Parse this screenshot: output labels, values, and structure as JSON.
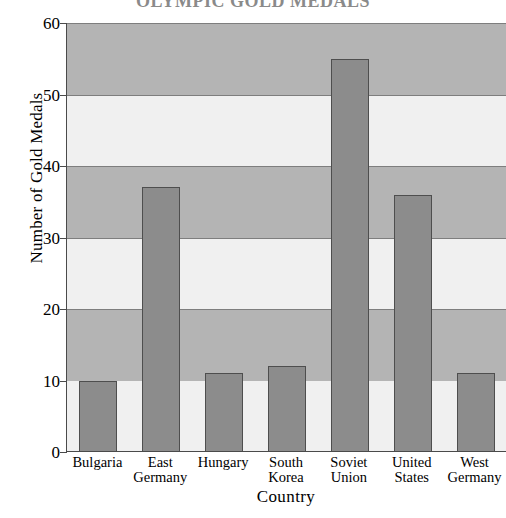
{
  "chart_data": {
    "type": "bar",
    "title": "OLYMPIC GOLD MEDALS",
    "xlabel": "Country",
    "ylabel": "Number of Gold Medals",
    "categories": [
      "Bulgaria",
      "East\nGermany",
      "Hungary",
      "South\nKorea",
      "Soviet\nUnion",
      "United\nStates",
      "West\nGermany"
    ],
    "values": [
      10,
      37,
      11,
      12,
      55,
      36,
      11
    ],
    "ylim": [
      0,
      60
    ],
    "yticks": [
      0,
      10,
      20,
      30,
      40,
      50,
      60
    ],
    "ytick_labels": [
      "0",
      "10",
      "20",
      "30",
      "40",
      "50",
      "60"
    ],
    "grid": true,
    "legend": "none",
    "bands": [
      {
        "from": 0,
        "to": 10,
        "shade": "light"
      },
      {
        "from": 10,
        "to": 20,
        "shade": "dark"
      },
      {
        "from": 20,
        "to": 30,
        "shade": "light"
      },
      {
        "from": 30,
        "to": 40,
        "shade": "dark"
      },
      {
        "from": 40,
        "to": 50,
        "shade": "light"
      },
      {
        "from": 50,
        "to": 60,
        "shade": "dark"
      }
    ],
    "colors": {
      "bar_fill": "#8c8c8c",
      "bar_edge": "#4e4e4e",
      "band_light": "#f0f0f0",
      "band_dark": "#b4b4b4",
      "axis": "#4a4a4a",
      "text": "#000000",
      "background": "#ffffff"
    }
  }
}
